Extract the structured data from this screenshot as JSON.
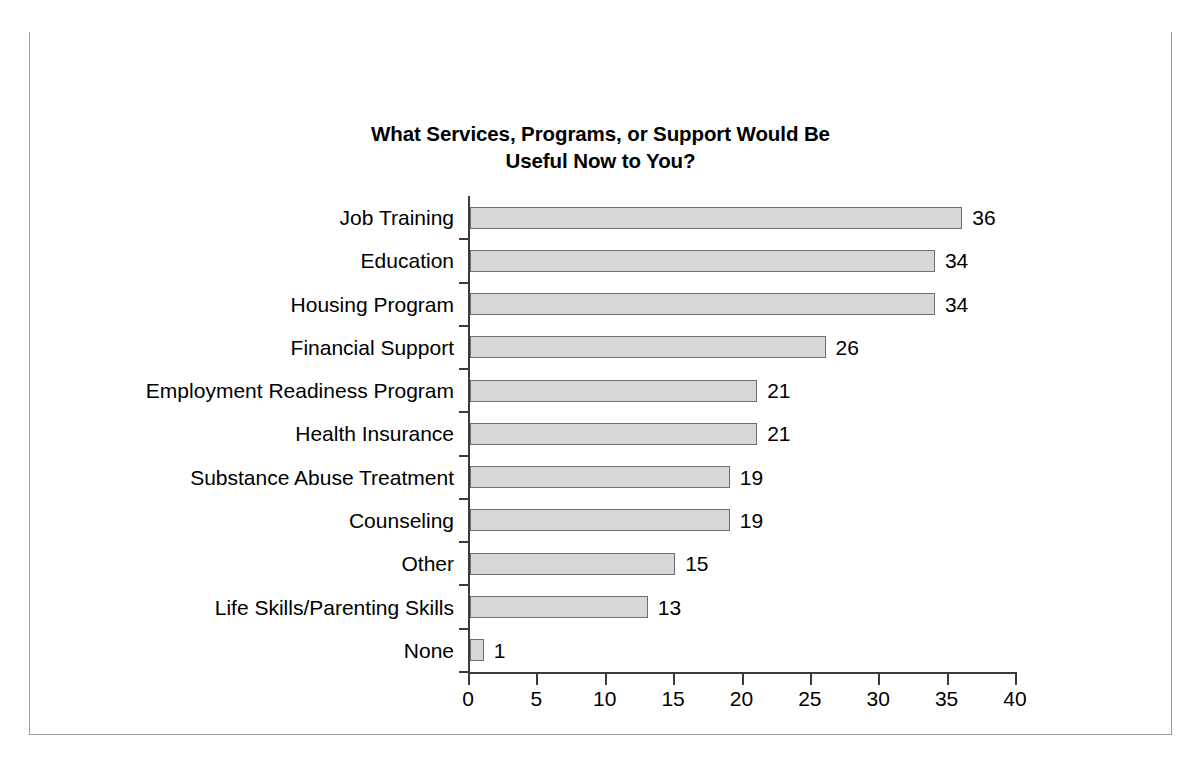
{
  "figure": {
    "number": "Figure 10.2",
    "separator": "●",
    "caption": "Services Needed During Reentry for Women",
    "header_bg": "#58585a",
    "header_text_color": "#ffffff"
  },
  "chart_data": {
    "type": "bar",
    "orientation": "horizontal",
    "title": "What Services, Programs, or Support Would Be Useful Now to You?",
    "title_line1": "What Services, Programs, or Support Would Be",
    "title_line2": "Useful Now to You?",
    "xlabel": "",
    "ylabel": "",
    "xlim": [
      0,
      40
    ],
    "xticks": [
      0,
      5,
      10,
      15,
      20,
      25,
      30,
      35,
      40
    ],
    "xticklabels": [
      "0",
      "5",
      "10",
      "15",
      "20",
      "25",
      "30",
      "35",
      "40"
    ],
    "grid": false,
    "legend": false,
    "bar_fill": "#d7d7d7",
    "bar_edge": "#6f6f6f",
    "categories": [
      "Job Training",
      "Education",
      "Housing Program",
      "Financial Support",
      "Employment Readiness Program",
      "Health Insurance",
      "Substance Abuse Treatment",
      "Counseling",
      "Other",
      "Life Skills/Parenting Skills",
      "None"
    ],
    "values": [
      36,
      34,
      34,
      26,
      21,
      21,
      19,
      19,
      15,
      13,
      1
    ],
    "value_labels": [
      "36",
      "34",
      "34",
      "26",
      "21",
      "21",
      "19",
      "19",
      "15",
      "13",
      "1"
    ]
  }
}
